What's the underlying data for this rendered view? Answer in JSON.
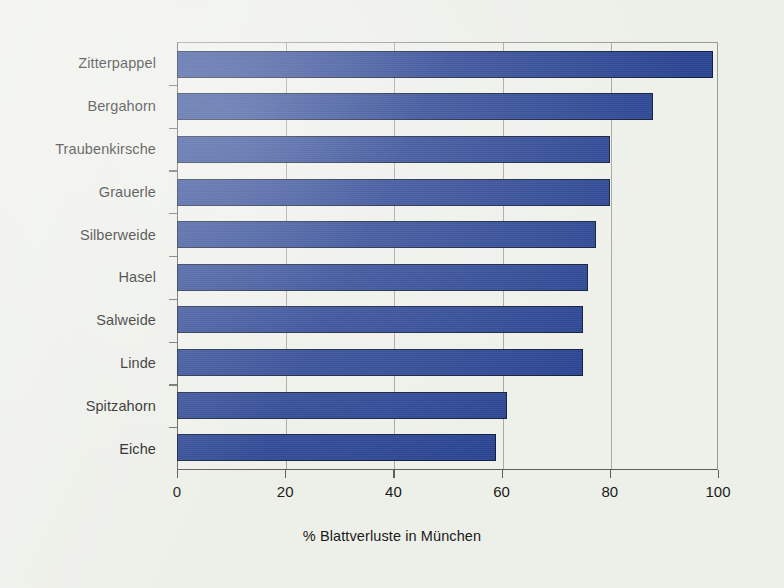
{
  "chart_data": {
    "type": "bar",
    "orientation": "horizontal",
    "title": "",
    "subtitle": "",
    "xlabel": "% Blattverluste in München",
    "ylabel": "",
    "categories": [
      "Zitterpappel",
      "Bergahorn",
      "Traubenkirsche",
      "Grauerle",
      "Silberweide",
      "Hasel",
      "Salweide",
      "Linde",
      "Spitzahorn",
      "Eiche"
    ],
    "values": [
      99,
      88,
      80,
      80,
      77.5,
      76,
      75,
      75,
      61,
      59
    ],
    "xlim": [
      0,
      100
    ],
    "xticks": [
      0,
      20,
      40,
      60,
      80,
      100
    ],
    "xtick_labels": [
      "0",
      "20",
      "40",
      "60",
      "80",
      "100"
    ],
    "grid": "vertical-only",
    "legend": "none",
    "bar_color": "#2b4593",
    "bar_edge_color": "#14203f",
    "plot_background": "#eef0ea",
    "page_background": "#edefe9",
    "axis_color": "#5d5d58",
    "gridline_color": "#a9a9a2",
    "text_color": "#1b1b19"
  }
}
